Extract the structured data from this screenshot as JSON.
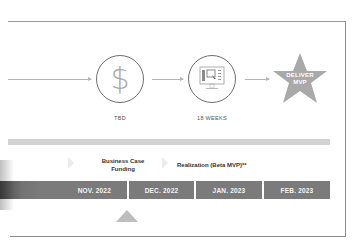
{
  "milestones": [
    {
      "icon": "dollar-icon",
      "symbol": "$",
      "label": "TBD"
    },
    {
      "icon": "monitor-wireframe-icon",
      "label": "18 WEEKS"
    },
    {
      "icon": "star-icon",
      "text_line1": "DELIVER",
      "text_line2": "MVP"
    }
  ],
  "phases": [
    {
      "line1": "Business Case",
      "line2": "Funding"
    },
    {
      "line1": "Realization (Beta MVP)**"
    }
  ],
  "months": [
    "NOV. 2022",
    "DEC. 2022",
    "JAN. 2023",
    "FEB. 2023"
  ],
  "colors": {
    "month_bar": "#7b7b7b",
    "star": "#a9a9a9",
    "band": "#d2d2d2",
    "marker": "#bdbdbd",
    "circle_border": "#6e6e6e"
  },
  "current_marker": {
    "position_under": "NOV. 2022 / DEC. 2022 boundary"
  }
}
